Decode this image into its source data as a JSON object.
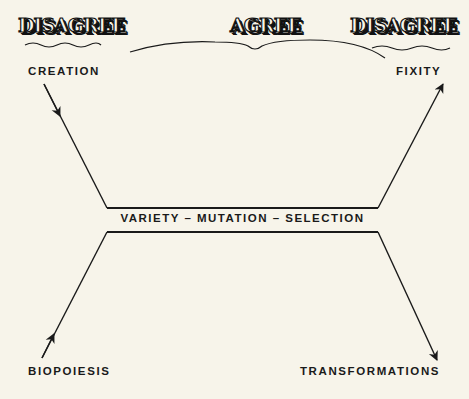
{
  "banners": {
    "left": "DISAGREE",
    "center": "AGREE",
    "right": "DISAGREE"
  },
  "nodes": {
    "top_left": "CREATION",
    "top_right": "FIXITY",
    "bottom_left": "BIOPOIESIS",
    "bottom_right": "TRANSFORMATIONS",
    "center": "VARIETY – MUTATION – SELECTION"
  },
  "colors": {
    "background": "#f7f4ea",
    "ink": "#1a1a1a"
  }
}
